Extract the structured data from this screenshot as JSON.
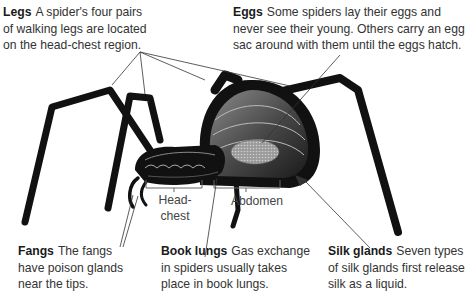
{
  "diagram": {
    "callouts": [
      {
        "id": "legs",
        "term": "Legs",
        "text": "A spider's four pairs of walking legs are located on the head-chest region.",
        "lines": [
          "A spider's four pairs",
          "of walking legs are located",
          "on the head-chest region."
        ]
      },
      {
        "id": "eggs",
        "term": "Eggs",
        "text": "Some spiders lay their eggs and never see their young. Others carry an egg sac around with them until the eggs hatch.",
        "lines": [
          "Some spiders lay their eggs and",
          "never see their young. Others carry an egg",
          "sac around with them until the eggs hatch."
        ]
      },
      {
        "id": "fangs",
        "term": "Fangs",
        "text": "The fangs have poison glands near the tips.",
        "lines": [
          "The fangs",
          "have poison glands",
          "near the tips."
        ]
      },
      {
        "id": "book-lungs",
        "term": "Book lungs",
        "text": "Gas exchange in spiders usually takes place in book lungs.",
        "lines": [
          "Gas exchange",
          "in spiders usually takes",
          "place in book lungs."
        ]
      },
      {
        "id": "silk-glands",
        "term": "Silk glands",
        "text": "Seven types of silk glands first release silk as a liquid.",
        "lines": [
          "Seven types",
          "of silk glands first release",
          "silk as a liquid."
        ]
      }
    ],
    "region_labels": {
      "head_chest": [
        "Head-",
        "chest"
      ],
      "abdomen": "Abdomen"
    },
    "colors": {
      "body": "#111111",
      "body_highlight": "#555555",
      "internal": "#777777",
      "leader_line": "#333333",
      "text": "#333333"
    }
  }
}
